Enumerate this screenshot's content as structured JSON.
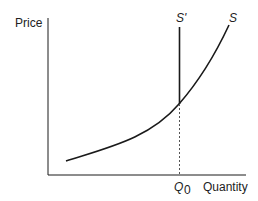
{
  "diagram": {
    "y_axis_label": "Price",
    "x_axis_label": "Quantity",
    "q_marker": {
      "base": "Q",
      "sub": "0"
    },
    "curves": [
      {
        "name": "S",
        "label": "S",
        "shape": "convex upward-sloping supply curve"
      },
      {
        "name": "S_prime",
        "label": "S'",
        "shape": "vertical line above Q0"
      }
    ],
    "colors": {
      "line": "#1a1a1a",
      "text": "#222222",
      "background": "#ffffff"
    }
  }
}
